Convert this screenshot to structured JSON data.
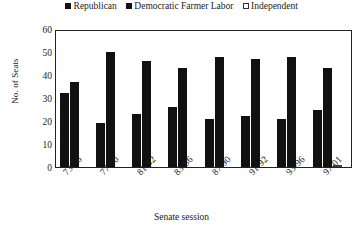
{
  "chart_data": {
    "type": "bar",
    "title": "",
    "xlabel": "Senate session",
    "ylabel": "No. of Seats",
    "ylim": [
      0,
      60
    ],
    "ytick_step": 10,
    "yticks": [
      0,
      10,
      20,
      30,
      40,
      50,
      60
    ],
    "grid": false,
    "legend_position": "top-center",
    "categories": [
      "73-76",
      "77-80",
      "81-82",
      "83-86",
      "87-90",
      "91-92",
      "93-96",
      "97-01"
    ],
    "series": [
      {
        "name": "Republican",
        "color": "#111111",
        "marker": "filled-square",
        "values": [
          32,
          19,
          23,
          26,
          21,
          22,
          21,
          25
        ]
      },
      {
        "name": "Democratic Farmer Labor",
        "color": "#111111",
        "marker": "filled-square",
        "values": [
          37,
          50,
          46,
          43,
          48,
          47,
          48,
          43
        ]
      },
      {
        "name": "Independent",
        "color": "#ffffff",
        "marker": "open-square",
        "values": [
          0,
          0,
          0,
          0,
          0,
          0,
          0,
          1
        ]
      }
    ]
  }
}
